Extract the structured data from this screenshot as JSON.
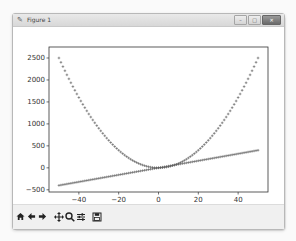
{
  "window": {
    "title": "Figure 1",
    "buttons": [
      "minimize",
      "maximize",
      "close"
    ]
  },
  "toolbar": {
    "buttons": [
      {
        "name": "home",
        "icon": "home-icon"
      },
      {
        "name": "back",
        "icon": "arrow-left-icon"
      },
      {
        "name": "forward",
        "icon": "arrow-right-icon"
      },
      {
        "name": "pan",
        "icon": "move-icon"
      },
      {
        "name": "zoom",
        "icon": "magnifier-icon"
      },
      {
        "name": "configure-subplots",
        "icon": "sliders-icon"
      },
      {
        "name": "save",
        "icon": "floppy-disk-icon"
      }
    ]
  },
  "colors": {
    "marker": "#555555",
    "axes": "#333333",
    "toolbar_bg": "#f0f0f0"
  },
  "chart_data": {
    "type": "scatter",
    "title": "",
    "xlabel": "",
    "ylabel": "",
    "xlim": [
      -55,
      55
    ],
    "ylim": [
      -550,
      2750
    ],
    "xticks": [
      -40,
      -20,
      0,
      20,
      40
    ],
    "xtick_labels": [
      "−40",
      "−20",
      "0",
      "20",
      "40"
    ],
    "yticks": [
      -500,
      0,
      500,
      1000,
      1500,
      2000,
      2500
    ],
    "ytick_labels": [
      "−500",
      "0",
      "500",
      "1000",
      "1500",
      "2000",
      "2500"
    ],
    "grid": false,
    "legend": null,
    "series": [
      {
        "name": "y = x^2",
        "marker": "+",
        "x_range": [
          -50,
          50
        ],
        "step": 1,
        "formula": "x^2",
        "sample_points": [
          [
            -50,
            2500
          ],
          [
            -40,
            1600
          ],
          [
            -20,
            400
          ],
          [
            0,
            0
          ],
          [
            20,
            400
          ],
          [
            40,
            1600
          ],
          [
            50,
            2500
          ]
        ]
      },
      {
        "name": "y = 8x",
        "marker": "+",
        "x_range": [
          -50,
          50
        ],
        "step": 1,
        "formula": "8x",
        "sample_points": [
          [
            -50,
            -400
          ],
          [
            -20,
            -160
          ],
          [
            0,
            0
          ],
          [
            20,
            160
          ],
          [
            50,
            400
          ]
        ]
      }
    ]
  }
}
